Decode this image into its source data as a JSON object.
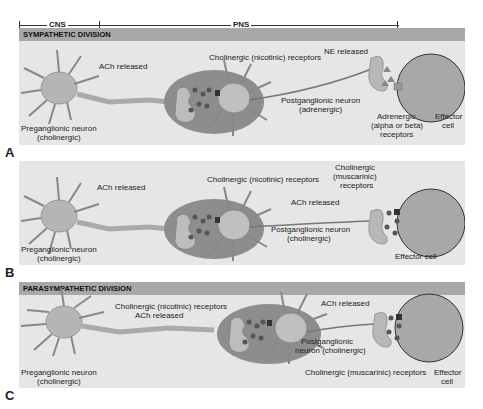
{
  "scale": {
    "cns": "CNS",
    "pns": "PNS"
  },
  "panels": [
    {
      "letter": "A",
      "header": "SYMPATHETIC DIVISION",
      "labels": {
        "preganglionic": "Preganglionic neuron",
        "preganglionic_type": "(cholinergic)",
        "ach_released": "ACh released",
        "nicotinic": "Cholinergic (nicotinic) receptors",
        "postganglionic": "Postganglionic neuron",
        "postganglionic_type": "(adrenergic)",
        "ne_released": "NE released",
        "adrenergic_1": "Adrenergic",
        "adrenergic_2": "(alpha or beta)",
        "adrenergic_3": "receptors",
        "effector_1": "Effector",
        "effector_2": "cell"
      }
    },
    {
      "letter": "B",
      "header": "",
      "labels": {
        "preganglionic": "Preganglionic neuron",
        "preganglionic_type": "(cholinergic)",
        "ach_released": "ACh released",
        "nicotinic": "Cholinergic (nicotinic) receptors",
        "postganglionic": "Postganglionic neuron",
        "postganglionic_type": "(cholinergic)",
        "ach_released_2": "ACh released",
        "muscarinic_1": "Cholinergic",
        "muscarinic_2": "(muscarinic)",
        "muscarinic_3": "receptors",
        "effector": "Effector cell"
      }
    },
    {
      "letter": "C",
      "header": "PARASYMPATHETIC DIVISION",
      "labels": {
        "preganglionic": "Preganglionic neuron",
        "preganglionic_type": "(cholinergic)",
        "nicotinic": "Cholinergic (nicotinic) receptors",
        "ach_released": "ACh released",
        "postganglionic_1": "Postganglionic",
        "postganglionic_2": "neuron (cholinergic)",
        "ach_released_2": "ACh released",
        "muscarinic": "Cholinergic (muscarinic) receptors",
        "effector_1": "Effector",
        "effector_2": "cell"
      }
    }
  ]
}
